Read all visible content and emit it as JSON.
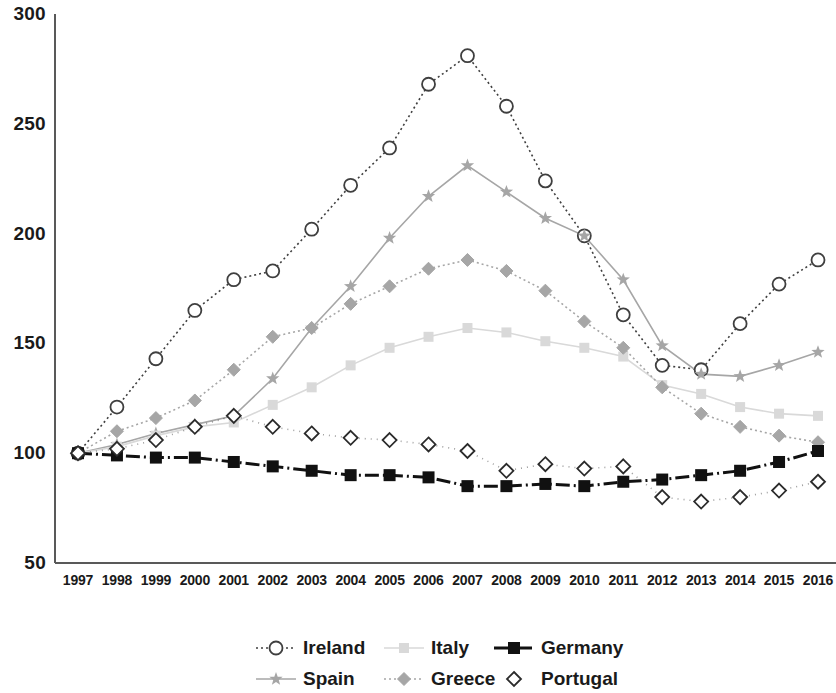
{
  "chart_data": {
    "type": "line",
    "title": "",
    "subtitle": "",
    "xlabel": "",
    "ylabel": "",
    "xlim": [
      1997,
      2016
    ],
    "ylim": [
      50,
      300
    ],
    "grid": false,
    "legend_position": "bottom",
    "y_ticks": [
      300,
      250,
      200,
      150,
      100,
      50
    ],
    "categories": [
      "1997",
      "1998",
      "1999",
      "2000",
      "2001",
      "2002",
      "2003",
      "2004",
      "2005",
      "2006",
      "2007",
      "2008",
      "2009",
      "2010",
      "2011",
      "2012",
      "2013",
      "2014",
      "2015",
      "2016"
    ],
    "series": [
      {
        "name": "Ireland",
        "color": "#3f3f3f",
        "marker": "circle-open",
        "line": "dotted",
        "values": [
          100,
          121,
          143,
          165,
          179,
          183,
          202,
          222,
          239,
          268,
          281,
          258,
          224,
          199,
          163,
          140,
          138,
          159,
          177,
          188
        ]
      },
      {
        "name": "Spain",
        "color": "#a6a6a6",
        "marker": "star",
        "line": "solid",
        "values": [
          100,
          104,
          109,
          113,
          117,
          134,
          157,
          176,
          198,
          217,
          231,
          219,
          207,
          199,
          179,
          149,
          136,
          135,
          140,
          146
        ]
      },
      {
        "name": "Italy",
        "color": "#d9d9d9",
        "marker": "square-light",
        "line": "solid",
        "values": [
          100,
          103,
          108,
          112,
          114,
          122,
          130,
          140,
          148,
          153,
          157,
          155,
          151,
          148,
          144,
          131,
          127,
          121,
          118,
          117
        ]
      },
      {
        "name": "Greece",
        "color": "#a6a6a6",
        "marker": "diamond-filled",
        "line": "dotted",
        "values": [
          100,
          110,
          116,
          124,
          138,
          153,
          157,
          168,
          176,
          184,
          188,
          183,
          174,
          160,
          148,
          130,
          118,
          112,
          108,
          105
        ]
      },
      {
        "name": "Germany",
        "color": "#111111",
        "marker": "square-filled",
        "line": "dash-dot",
        "values": [
          100,
          99,
          98,
          98,
          96,
          94,
          92,
          90,
          90,
          89,
          85,
          85,
          86,
          85,
          87,
          88,
          90,
          92,
          96,
          101
        ]
      },
      {
        "name": "Portugal",
        "color": "#2b2b2b",
        "marker": "diamond-open",
        "line": "dotted-faint",
        "values": [
          100,
          102,
          106,
          112,
          117,
          112,
          109,
          107,
          106,
          104,
          101,
          92,
          95,
          93,
          94,
          80,
          78,
          80,
          83,
          87
        ]
      }
    ]
  },
  "legend": {
    "items": [
      {
        "label": "Ireland"
      },
      {
        "label": "Italy"
      },
      {
        "label": "Germany"
      },
      {
        "label": "Spain"
      },
      {
        "label": "Greece"
      },
      {
        "label": "Portugal"
      }
    ]
  },
  "axes": {
    "y_labels": [
      "300",
      "250",
      "200",
      "150",
      "100",
      "50"
    ],
    "x_labels": [
      "1997",
      "1998",
      "1999",
      "2000",
      "2001",
      "2002",
      "2003",
      "2004",
      "2005",
      "2006",
      "2007",
      "2008",
      "2009",
      "2010",
      "2011",
      "2012",
      "2013",
      "2014",
      "2015",
      "2016"
    ]
  },
  "colors": {
    "axis": "#595959",
    "text": "#1a1a1a",
    "ireland": "#3f3f3f",
    "spain": "#a6a6a6",
    "italy": "#d9d9d9",
    "greece": "#a6a6a6",
    "germany": "#111111",
    "portugal": "#2b2b2b"
  }
}
